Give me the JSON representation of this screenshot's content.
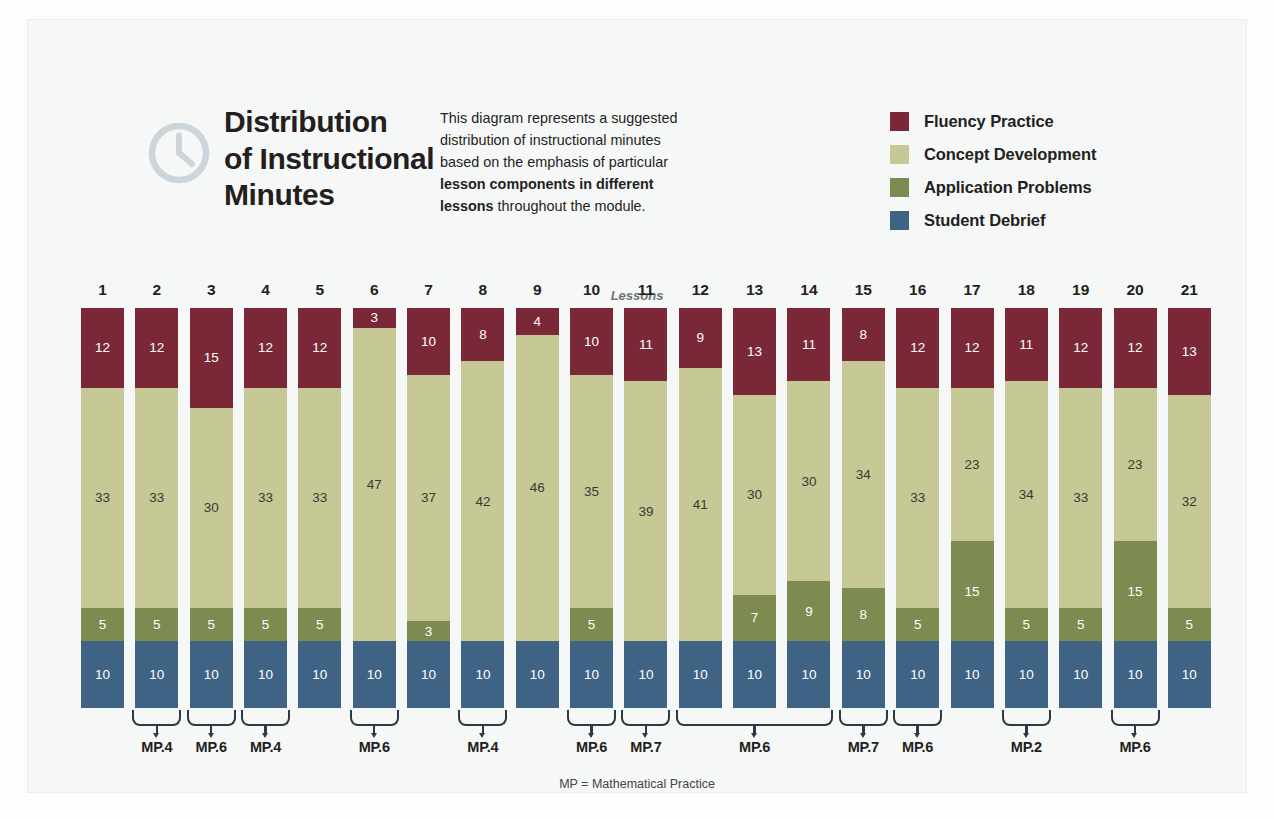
{
  "header": {
    "icon": "clock-icon",
    "title_lines": [
      "Distribution",
      "of Instructional",
      "Minutes"
    ],
    "description_part1": "This diagram represents a suggested distribution of instructional minutes based on the emphasis of particular ",
    "description_bold": "lesson components in different lessons",
    "description_part2": " throughout the module."
  },
  "legend": {
    "items": [
      {
        "label": "Fluency Practice",
        "color": "#7a2838",
        "key": "fluency"
      },
      {
        "label": "Concept Development",
        "color": "#c6c896",
        "key": "concept"
      },
      {
        "label": "Application Problems",
        "color": "#7d8a50",
        "key": "application"
      },
      {
        "label": "Student Debrief",
        "color": "#3f6384",
        "key": "debrief"
      }
    ]
  },
  "chart": {
    "axis_caption": "Lessons",
    "footnote": "MP = Mathematical Practice"
  },
  "chart_data": {
    "type": "bar",
    "subtype": "stacked-vertical",
    "title": "Distribution of Instructional Minutes",
    "xlabel": "Lessons",
    "ylabel": "Instructional minutes",
    "grid": false,
    "legend_position": "top-right",
    "categories": [
      "1",
      "2",
      "3",
      "4",
      "5",
      "6",
      "7",
      "8",
      "9",
      "10",
      "11",
      "12",
      "13",
      "14",
      "15",
      "16",
      "17",
      "18",
      "19",
      "20",
      "21"
    ],
    "stack_order_bottom_to_top": [
      "Student Debrief",
      "Application Problems",
      "Concept Development",
      "Fluency Practice"
    ],
    "series": [
      {
        "name": "Fluency Practice",
        "color": "#7a2838",
        "values": [
          12,
          12,
          15,
          12,
          12,
          3,
          10,
          8,
          4,
          10,
          11,
          9,
          13,
          11,
          8,
          12,
          12,
          11,
          12,
          12,
          13
        ]
      },
      {
        "name": "Concept Development",
        "color": "#c6c896",
        "values": [
          33,
          33,
          30,
          33,
          33,
          47,
          37,
          42,
          46,
          35,
          39,
          41,
          30,
          30,
          34,
          33,
          23,
          34,
          33,
          23,
          32
        ]
      },
      {
        "name": "Application Problems",
        "color": "#7d8a50",
        "values": [
          5,
          5,
          5,
          5,
          5,
          0,
          3,
          0,
          0,
          5,
          0,
          0,
          7,
          9,
          8,
          5,
          15,
          5,
          5,
          15,
          5
        ]
      },
      {
        "name": "Student Debrief",
        "color": "#3f6384",
        "values": [
          10,
          10,
          10,
          10,
          10,
          10,
          10,
          10,
          10,
          10,
          10,
          10,
          10,
          10,
          10,
          10,
          10,
          10,
          10,
          10,
          10
        ]
      }
    ],
    "totals": [
      60,
      60,
      60,
      60,
      60,
      60,
      60,
      60,
      60,
      60,
      60,
      60,
      60,
      60,
      60,
      60,
      60,
      60,
      60,
      60,
      60
    ],
    "ylim": [
      0,
      60
    ],
    "annotations": {
      "mathematical_practice_brackets": [
        {
          "label": "MP.4",
          "lessons": [
            2,
            2
          ]
        },
        {
          "label": "MP.6",
          "lessons": [
            3,
            3
          ]
        },
        {
          "label": "MP.4",
          "lessons": [
            4,
            4
          ]
        },
        {
          "label": "MP.6",
          "lessons": [
            6,
            6
          ]
        },
        {
          "label": "MP.4",
          "lessons": [
            8,
            8
          ]
        },
        {
          "label": "MP.6",
          "lessons": [
            10,
            10
          ]
        },
        {
          "label": "MP.7",
          "lessons": [
            11,
            11
          ]
        },
        {
          "label": "MP.6",
          "lessons": [
            12,
            14
          ]
        },
        {
          "label": "MP.7",
          "lessons": [
            15,
            15
          ]
        },
        {
          "label": "MP.6",
          "lessons": [
            16,
            16
          ]
        },
        {
          "label": "MP.2",
          "lessons": [
            18,
            18
          ]
        },
        {
          "label": "MP.6",
          "lessons": [
            20,
            20
          ]
        }
      ]
    }
  }
}
